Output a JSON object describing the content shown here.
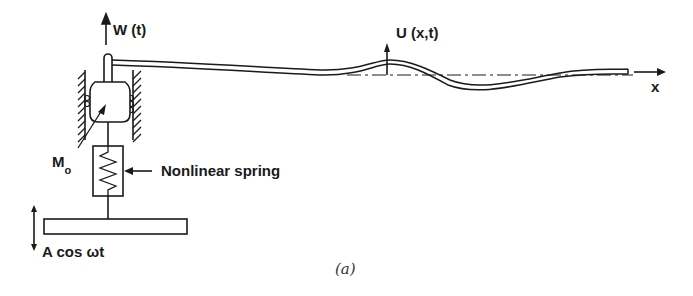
{
  "figure": {
    "caption": "(a)",
    "labels": {
      "base_displacement": "W (t)",
      "beam_deflection": "U (x,t)",
      "axis": "x",
      "mass_main": "M",
      "mass_sub": "o",
      "spring": "Nonlinear spring",
      "excitation": "A cos ωt"
    },
    "colors": {
      "ink": "#1a1a1a",
      "background": "#ffffff"
    }
  }
}
